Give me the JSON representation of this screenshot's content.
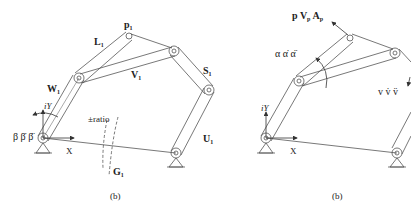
{
  "figures": [
    {
      "id": "left",
      "caption": "(b)",
      "labels": {
        "pin": "p",
        "pin_sub": "1",
        "link_top": "L",
        "link_top_sub": "1",
        "link_left": "W",
        "link_left_sub": "1",
        "link_mid": "V",
        "link_mid_sub": "1",
        "link_right": "S",
        "link_right_sub": "1",
        "link_base_right": "U",
        "link_base_right_sub": "1",
        "ground": "G",
        "ground_sub": "1",
        "ratio": "±ratio",
        "angle": "β β̇ β̈",
        "axis_y": "iY",
        "axis_x": "X"
      }
    },
    {
      "id": "right",
      "caption": "(b)",
      "labels": {
        "point": "p V",
        "point_vsub": "p",
        "point_a": " A",
        "point_asub": "p",
        "angle": "α α̇ α̈",
        "vel": "v v̇ v̈",
        "axis_y": "iY",
        "axis_x": "X"
      }
    }
  ],
  "colors": {
    "line": "#555555",
    "text": "#222222",
    "background": "#ffffff"
  }
}
